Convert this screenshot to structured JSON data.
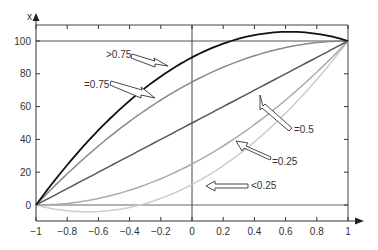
{
  "chart_data": {
    "type": "line",
    "title": "",
    "xlabel": "",
    "ylabel": "x",
    "xlim": [
      -1,
      1
    ],
    "ylim": [
      -10,
      110
    ],
    "x_ticks": [
      "-1",
      "-0.8",
      "-0.6",
      "-0.4",
      "-0.2",
      "0",
      "0.2",
      "0.4",
      "0.6",
      "0.8",
      "1"
    ],
    "y_ticks": [
      "0",
      "20",
      "40",
      "60",
      "80",
      "100"
    ],
    "grid": false,
    "reference_lines": {
      "horizontal": [
        0,
        100
      ],
      "vertical": [
        0
      ]
    },
    "x": [
      -1,
      -0.8,
      -0.6,
      -0.4,
      -0.2,
      0,
      0.2,
      0.4,
      0.6,
      0.8,
      1
    ],
    "series": [
      {
        "name": ">0.75",
        "color": "#111111",
        "values": [
          0,
          24.4,
          44.8,
          61.2,
          73.6,
          82,
          86.4,
          86.8,
          83.2,
          75.6,
          100
        ]
      },
      {
        "name": "=0.75",
        "color": "#888888",
        "values": [
          0,
          19,
          36,
          51,
          64,
          75,
          84,
          91,
          96,
          99,
          100
        ]
      },
      {
        "name": "=0.5",
        "color": "#555555",
        "values": [
          0,
          10,
          20,
          30,
          40,
          50,
          60,
          70,
          80,
          90,
          100
        ]
      },
      {
        "name": "=0.25",
        "color": "#aaaaaa",
        "values": [
          0,
          1,
          4,
          9,
          16,
          25,
          36,
          49,
          64,
          81,
          100
        ]
      },
      {
        "name": "<0.25",
        "color": "#cccccc",
        "values": [
          0,
          -3.5,
          -4,
          -1.5,
          4,
          12.5,
          24,
          38.5,
          56,
          76.5,
          100
        ]
      }
    ],
    "annotations": [
      {
        "text": ">0.75",
        "target_series": ">0.75"
      },
      {
        "text": "=0.75",
        "target_series": "=0.75"
      },
      {
        "text": "=0.5",
        "target_series": "=0.5"
      },
      {
        "text": "=0.25",
        "target_series": "=0.25"
      },
      {
        "text": "<0.25",
        "target_series": "<0.25"
      }
    ]
  },
  "labels": {
    "y_axis": "x",
    "ann_gt075": ">0.75",
    "ann_eq075": "=0.75",
    "ann_eq05": "=0.5",
    "ann_eq025": "=0.25",
    "ann_lt025": "<0.25"
  }
}
